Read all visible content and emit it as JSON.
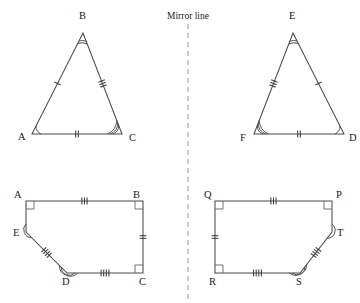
{
  "figure": {
    "mirror_label": "Mirror line",
    "mirror_line_x": 188,
    "stroke_color": "#4a4a4a",
    "mirror_color": "#8a9bb0",
    "background": "#ffffff"
  },
  "triangles": {
    "left": {
      "name": "triangle-ABC",
      "vertices": [
        {
          "label": "A",
          "x": 32,
          "y": 134,
          "label_x": 18,
          "label_y": 140,
          "arcs": 1
        },
        {
          "label": "B",
          "x": 83,
          "y": 33,
          "label_x": 79,
          "label_y": 19,
          "arcs": 2
        },
        {
          "label": "C",
          "x": 122,
          "y": 134,
          "label_x": 129,
          "label_y": 141,
          "arcs": 3
        }
      ],
      "sides": [
        {
          "from": "A",
          "to": "B",
          "ticks": 1
        },
        {
          "from": "B",
          "to": "C",
          "ticks": 3
        },
        {
          "from": "A",
          "to": "C",
          "ticks": 2
        }
      ]
    },
    "right": {
      "name": "triangle-DEF",
      "vertices": [
        {
          "label": "D",
          "x": 344,
          "y": 134,
          "label_x": 349,
          "label_y": 141,
          "arcs": 1
        },
        {
          "label": "E",
          "x": 293,
          "y": 33,
          "label_x": 289,
          "label_y": 19,
          "arcs": 2
        },
        {
          "label": "F",
          "x": 254,
          "y": 134,
          "label_x": 240,
          "label_y": 141,
          "arcs": 3
        }
      ],
      "sides": [
        {
          "from": "F",
          "to": "E",
          "ticks": 3
        },
        {
          "from": "E",
          "to": "D",
          "ticks": 1
        },
        {
          "from": "F",
          "to": "D",
          "ticks": 2
        }
      ]
    }
  },
  "pentagons": {
    "left": {
      "name": "pentagon-ABCDE",
      "vertices": [
        {
          "label": "A",
          "x": 26,
          "y": 201,
          "label_x": 14,
          "label_y": 198,
          "mark": "right-angle"
        },
        {
          "label": "B",
          "x": 143,
          "y": 201,
          "label_x": 133,
          "label_y": 198,
          "mark": "right-angle"
        },
        {
          "label": "C",
          "x": 143,
          "y": 273,
          "label_x": 139,
          "label_y": 285,
          "mark": "right-angle"
        },
        {
          "label": "D",
          "x": 67,
          "y": 273,
          "label_x": 62,
          "label_y": 285,
          "mark": "arc-2"
        },
        {
          "label": "E",
          "x": 26,
          "y": 232,
          "label_x": 13,
          "label_y": 236,
          "mark": "arc-1"
        }
      ],
      "sides": [
        {
          "from": "A",
          "to": "B",
          "ticks": 3
        },
        {
          "from": "B",
          "to": "C",
          "ticks": 2
        },
        {
          "from": "C",
          "to": "D",
          "ticks": 4
        },
        {
          "from": "D",
          "to": "E",
          "ticks": 4
        },
        {
          "from": "E",
          "to": "A",
          "ticks": 0
        }
      ]
    },
    "right": {
      "name": "pentagon-PQRST",
      "vertices": [
        {
          "label": "P",
          "x": 332,
          "y": 201,
          "label_x": 336,
          "label_y": 198,
          "mark": "right-angle"
        },
        {
          "label": "Q",
          "x": 215,
          "y": 201,
          "label_x": 204,
          "label_y": 198,
          "mark": "right-angle"
        },
        {
          "label": "R",
          "x": 215,
          "y": 273,
          "label_x": 209,
          "label_y": 285,
          "mark": "right-angle"
        },
        {
          "label": "S",
          "x": 300,
          "y": 273,
          "label_x": 296,
          "label_y": 285,
          "mark": "arc-2"
        },
        {
          "label": "T",
          "x": 332,
          "y": 232,
          "label_x": 337,
          "label_y": 236,
          "mark": "arc-1"
        }
      ],
      "sides": [
        {
          "from": "Q",
          "to": "P",
          "ticks": 3
        },
        {
          "from": "Q",
          "to": "R",
          "ticks": 2
        },
        {
          "from": "R",
          "to": "S",
          "ticks": 4
        },
        {
          "from": "S",
          "to": "T",
          "ticks": 4
        },
        {
          "from": "T",
          "to": "P",
          "ticks": 0
        }
      ]
    }
  }
}
